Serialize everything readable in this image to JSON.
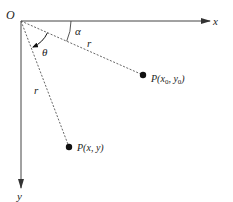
{
  "diagram": {
    "origin_label": "O",
    "x_axis_label": "x",
    "y_axis_label": "y",
    "angle_alpha_label": "α",
    "angle_theta_label": "θ",
    "radius_label_1": "r",
    "radius_label_2": "r",
    "point_p0": {
      "prefix": "P(",
      "x": "x",
      "x_sub": "0",
      "sep": ", ",
      "y": "y",
      "y_sub": "0",
      "suffix": ")"
    },
    "point_p": {
      "label": "P(x, y)"
    }
  },
  "colors": {
    "axis": "#444444",
    "dashed": "#555555",
    "point": "#111111",
    "text": "#222222"
  }
}
